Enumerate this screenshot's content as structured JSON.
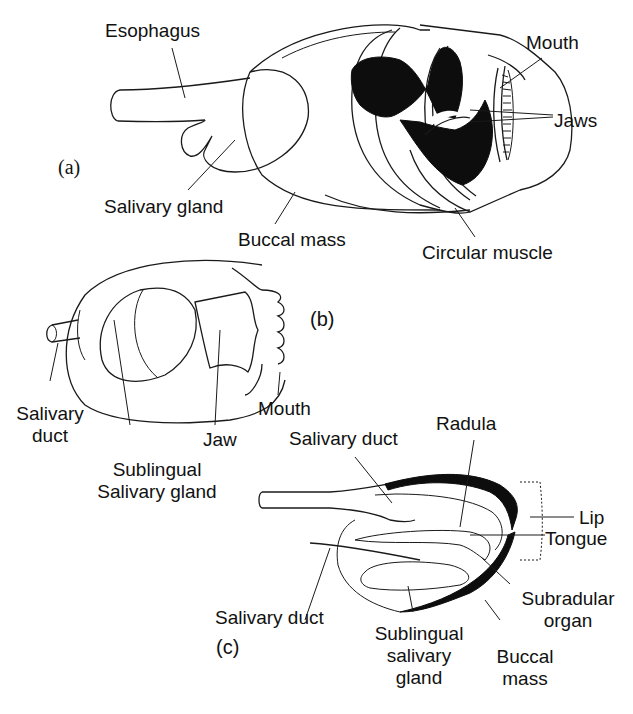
{
  "figure": {
    "panels": {
      "a": {
        "tag": "(a)",
        "labels": {
          "esophagus": "Esophagus",
          "mouth": "Mouth",
          "jaws": "Jaws",
          "salivary_gland": "Salivary gland",
          "buccal_mass": "Buccal mass",
          "circular_muscle": "Circular muscle"
        }
      },
      "b": {
        "tag": "(b)",
        "labels": {
          "salivary_duct_line1": "Salivary",
          "salivary_duct_line2": "duct",
          "jaw": "Jaw",
          "mouth": "Mouth",
          "sublingual_line1": "Sublingual",
          "sublingual_line2": "Salivary gland"
        }
      },
      "c": {
        "tag": "(c)",
        "labels": {
          "salivary_duct_top": "Salivary duct",
          "radula": "Radula",
          "lip": "Lip",
          "tongue": "Tongue",
          "salivary_duct_bottom": "Salivary duct",
          "subradular_line1": "Subradular",
          "subradular_line2": "organ",
          "sublingual_line1": "Sublingual",
          "sublingual_line2": "salivary",
          "sublingual_line3": "gland",
          "buccal_line1": "Buccal",
          "buccal_line2": "mass"
        }
      }
    },
    "colors": {
      "ink": "#111111",
      "background": "#ffffff"
    }
  }
}
